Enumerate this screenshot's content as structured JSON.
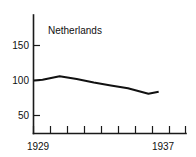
{
  "chart_data": {
    "type": "line",
    "title": "Netherlands",
    "xlabel": "",
    "ylabel": "",
    "grid": false,
    "legend": false,
    "legend_position": "none",
    "x": [
      1929,
      1929.5,
      1930.5,
      1931.5,
      1932.5,
      1933.5,
      1934.5,
      1935.7,
      1936.3
    ],
    "y": [
      100,
      101,
      106,
      102,
      97,
      93,
      89,
      81,
      84
    ],
    "series": [
      {
        "name": "Netherlands",
        "values": [
          100,
          101,
          106,
          102,
          97,
          93,
          89,
          81,
          84
        ]
      }
    ],
    "xlim": [
      1929,
      1937.9
    ],
    "ylim": [
      0,
      172
    ],
    "y_ticks": [
      50,
      100,
      150
    ],
    "y_tick_labels": [
      "50",
      "100",
      "150"
    ],
    "x_tick_count": 10,
    "x_tick_labels_shown": [
      "1929",
      "1937"
    ],
    "line_color": "#111111",
    "axis_color": "#1a1a1a",
    "background_color": "#ffffff"
  },
  "axes": {
    "y_ticks": [
      {
        "label": "150",
        "value": 150
      },
      {
        "label": "100",
        "value": 100
      },
      {
        "label": "50",
        "value": 50
      }
    ],
    "x_labels": {
      "start": "1929",
      "end": "1937"
    }
  }
}
